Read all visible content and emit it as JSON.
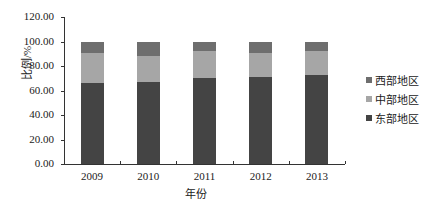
{
  "chart_data": {
    "type": "bar",
    "stacked": true,
    "title": "",
    "xlabel": "年份",
    "ylabel": "比例/%",
    "ylim": [
      0,
      120
    ],
    "yticks": [
      "0.00",
      "20.00",
      "40.00",
      "60.00",
      "80.00",
      "100.00",
      "120.00"
    ],
    "categories": [
      "2009",
      "2010",
      "2011",
      "2012",
      "2013"
    ],
    "series": [
      {
        "name": "东部地区",
        "color": "#444444",
        "values": [
          66.5,
          67.0,
          70.0,
          71.0,
          72.5
        ]
      },
      {
        "name": "中部地区",
        "color": "#a6a6a6",
        "values": [
          24.5,
          21.5,
          22.0,
          20.0,
          20.0
        ]
      },
      {
        "name": "西部地区",
        "color": "#6e6e6e",
        "values": [
          9.0,
          11.5,
          8.0,
          9.0,
          7.5
        ]
      }
    ],
    "legend": {
      "position": "right",
      "order": [
        "西部地区",
        "中部地区",
        "东部地区"
      ]
    },
    "grid": false
  },
  "legend_labels": [
    "西部地区",
    "中部地区",
    "东部地区"
  ]
}
